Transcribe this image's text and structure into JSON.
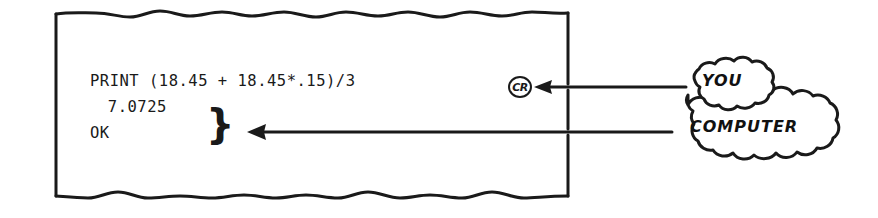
{
  "figure": {
    "name": "terminal-printout-annotated",
    "background_color": "#ffffff",
    "ink_color": "#1a1a1a"
  },
  "printout": {
    "name": "paper-printout",
    "edge_style": "torn-wavy-top-and-bottom",
    "lines": [
      {
        "id": "input-line",
        "text": "PRINT (18.45 + 18.45*.15)/3",
        "source": "user"
      },
      {
        "id": "result-line",
        "text": " 7.0725",
        "source": "computer"
      },
      {
        "id": "ok-line",
        "text": "OK",
        "source": "computer"
      }
    ],
    "cr_token": {
      "label": "CR",
      "description": "circled carriage-return key symbol"
    },
    "output_brace": "}"
  },
  "callouts": [
    {
      "id": "you-callout",
      "label": "YOU",
      "points_to": "input-line",
      "shape": "cloud"
    },
    {
      "id": "computer-callout",
      "label": "COMPUTER",
      "points_to": "output-brace",
      "shape": "cloud"
    }
  ],
  "arrows": [
    {
      "id": "you-arrow",
      "direction": "left",
      "from": "you-callout",
      "to": "cr-token"
    },
    {
      "id": "computer-arrow",
      "direction": "left",
      "from": "computer-callout",
      "to": "output-brace"
    }
  ]
}
